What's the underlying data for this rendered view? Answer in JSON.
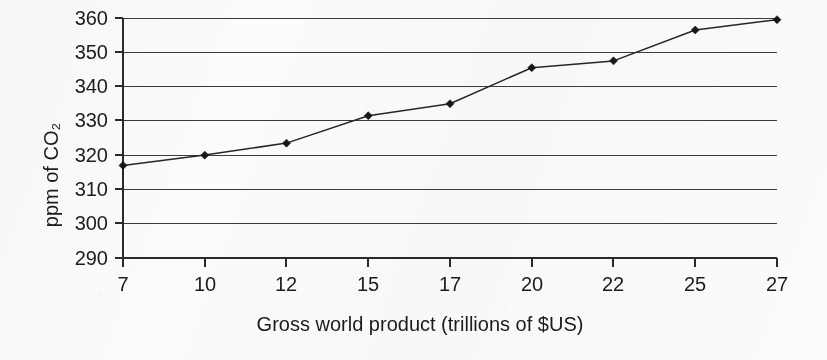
{
  "chart_data": {
    "type": "line",
    "title": "",
    "xlabel": "Gross world product (trillions of $US)",
    "ylabel": "ppm of CO₂",
    "categories": [
      "7",
      "10",
      "12",
      "15",
      "17",
      "20",
      "22",
      "25",
      "27"
    ],
    "x": [
      7,
      10,
      12,
      15,
      17,
      20,
      22,
      25,
      27
    ],
    "values": [
      317,
      320,
      323.5,
      331.5,
      335,
      345.5,
      347.5,
      356.5,
      359.5
    ],
    "ylim": [
      290,
      360
    ],
    "yticks": [
      290,
      300,
      310,
      320,
      330,
      340,
      350,
      360
    ],
    "ytick_labels": [
      "290",
      "300",
      "310",
      "320",
      "330",
      "340",
      "350",
      "360"
    ],
    "grid": "horizontal",
    "legend": "none",
    "marker": "diamond",
    "line_color": "#262626",
    "marker_color": "#171717",
    "gridline_color": "#3c3c3c",
    "axis_color": "#2a2a2a",
    "background_color": "#fbfbfa"
  },
  "axes": {
    "y_axis_label": "ppm of CO₂",
    "x_axis_label": "Gross world product (trillions of $US)"
  }
}
